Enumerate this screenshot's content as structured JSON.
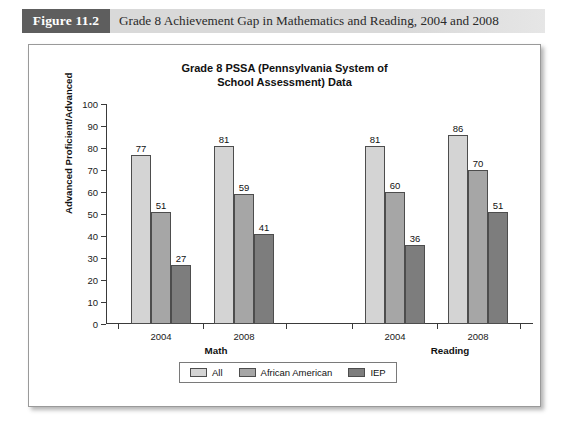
{
  "figure": {
    "number": "Figure 11.2",
    "caption": "Grade 8 Achievement Gap in Mathematics and Reading, 2004 and 2008"
  },
  "colors": {
    "all": "#d4d4d4",
    "african_american": "#a6a6a6",
    "iep": "#7d7d7d",
    "axis": "#3a3a3a",
    "figure_box": "#5e5e5e",
    "header_band": "#d9d9d9"
  },
  "chart_data": {
    "type": "bar",
    "title": "Grade 8 PSSA (Pennsylvania System of School Assessment) Data",
    "title_lines": [
      "Grade 8 PSSA (Pennsylvania System of",
      "School Assessment) Data"
    ],
    "xlabel": "",
    "ylabel": "Advanced Proficient/Advanced",
    "ylim": [
      0,
      100
    ],
    "ytick_step": 10,
    "yticks": [
      0,
      10,
      20,
      30,
      40,
      50,
      60,
      70,
      80,
      90,
      100
    ],
    "grid": false,
    "legend_position": "bottom",
    "categories": [
      "2004",
      "2008",
      "2004",
      "2008"
    ],
    "groups": [
      {
        "label": "Math",
        "categories": [
          "2004",
          "2008"
        ]
      },
      {
        "label": "Reading",
        "categories": [
          "2004",
          "2008"
        ]
      }
    ],
    "series": [
      {
        "name": "All",
        "values": [
          77,
          81,
          81,
          86
        ]
      },
      {
        "name": "African American",
        "values": [
          51,
          59,
          60,
          70
        ]
      },
      {
        "name": "IEP",
        "values": [
          27,
          41,
          36,
          51
        ]
      }
    ],
    "bars": [
      {
        "group": "Math",
        "year": "2004",
        "series": "All",
        "value": 77
      },
      {
        "group": "Math",
        "year": "2004",
        "series": "African American",
        "value": 51
      },
      {
        "group": "Math",
        "year": "2004",
        "series": "IEP",
        "value": 27
      },
      {
        "group": "Math",
        "year": "2008",
        "series": "All",
        "value": 81
      },
      {
        "group": "Math",
        "year": "2008",
        "series": "African American",
        "value": 59
      },
      {
        "group": "Math",
        "year": "2008",
        "series": "IEP",
        "value": 41
      },
      {
        "group": "Reading",
        "year": "2004",
        "series": "All",
        "value": 81
      },
      {
        "group": "Reading",
        "year": "2004",
        "series": "African American",
        "value": 60
      },
      {
        "group": "Reading",
        "year": "2004",
        "series": "IEP",
        "value": 36
      },
      {
        "group": "Reading",
        "year": "2008",
        "series": "All",
        "value": 86
      },
      {
        "group": "Reading",
        "year": "2008",
        "series": "African American",
        "value": 70
      },
      {
        "group": "Reading",
        "year": "2008",
        "series": "IEP",
        "value": 51
      }
    ],
    "legend": [
      {
        "label": "All",
        "color": "#d4d4d4"
      },
      {
        "label": "African American",
        "color": "#a6a6a6"
      },
      {
        "label": "IEP",
        "color": "#7d7d7d"
      }
    ]
  }
}
